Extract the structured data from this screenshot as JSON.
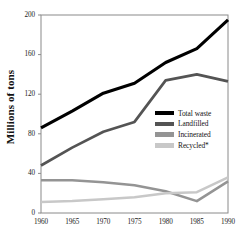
{
  "chart_data": {
    "type": "line",
    "title": "",
    "xlabel": "",
    "ylabel": "Millions of tons",
    "x": [
      1960,
      1965,
      1970,
      1975,
      1980,
      1985,
      1990
    ],
    "xtick_labels": [
      "1960",
      "1965",
      "1970",
      "1975",
      "1980",
      "1985",
      "1990"
    ],
    "ytick_labels": [
      "0",
      "40",
      "80",
      "120",
      "160",
      "200"
    ],
    "yticks": [
      0,
      40,
      80,
      120,
      160,
      200
    ],
    "xlim": [
      1960,
      1990
    ],
    "ylim": [
      0,
      200
    ],
    "grid": false,
    "legend_position": "center-right",
    "series": [
      {
        "name": "Total waste",
        "color": "#000000",
        "values": [
          86,
          103,
          121,
          131,
          152,
          166,
          195
        ]
      },
      {
        "name": "Landfilled",
        "color": "#545454",
        "values": [
          48,
          66,
          82,
          92,
          134,
          140,
          133
        ]
      },
      {
        "name": "Incinerated",
        "color": "#949494",
        "values": [
          33,
          33,
          31,
          28,
          22,
          12,
          32
        ]
      },
      {
        "name": "Recycled*",
        "color": "#c8c8c8",
        "values": [
          11,
          12,
          14,
          16,
          20,
          21,
          36
        ]
      }
    ]
  },
  "legend": {
    "items": [
      {
        "label": "Total waste",
        "color": "#000000"
      },
      {
        "label": "Landfilled",
        "color": "#545454"
      },
      {
        "label": "Incinerated",
        "color": "#949494"
      },
      {
        "label": "Recycled*",
        "color": "#c8c8c8"
      }
    ]
  },
  "axes": {
    "y_title": "Millions of tons",
    "y_ticks": [
      "200",
      "160",
      "120",
      "80",
      "40",
      "0"
    ],
    "x_ticks": [
      "1960",
      "1965",
      "1970",
      "1975",
      "1980",
      "1985",
      "1990"
    ]
  },
  "colors": {
    "frame": "#8a8a8a",
    "background": "#ffffff",
    "text": "#111111"
  }
}
